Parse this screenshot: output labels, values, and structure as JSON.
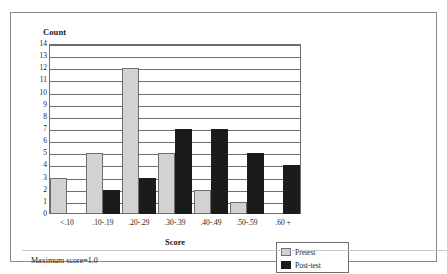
{
  "figure": {
    "footer_note": "Maximum score=1.0"
  },
  "chart_data": {
    "type": "bar",
    "title": "",
    "xlabel": "Score",
    "ylabel": "Count",
    "categories": [
      "<.10",
      ".10-.19",
      ".20-.29",
      ".30-.39",
      ".40-.49",
      ".50-.59",
      ".60 +"
    ],
    "series": [
      {
        "name": "Pretest",
        "color": "#d2d2d2",
        "values": [
          3,
          5,
          12,
          5,
          2,
          1,
          0
        ]
      },
      {
        "name": "Post-test",
        "color": "#1b1b1b",
        "values": [
          0,
          2,
          3,
          7,
          7,
          5,
          4
        ]
      }
    ],
    "ylim": [
      0,
      14
    ],
    "yticks": [
      0,
      1,
      2,
      3,
      4,
      5,
      6,
      7,
      8,
      9,
      10,
      11,
      12,
      13,
      14
    ],
    "ytick_labels": [
      "0",
      "1",
      "2",
      "3",
      "4",
      "5",
      "6",
      "7",
      "8",
      "9",
      "10",
      "11",
      "12",
      "13",
      "14"
    ],
    "grid": true,
    "grid_axis": "y",
    "legend_position": "bottom-right",
    "legend_entries": [
      "Pretest",
      "Post-test"
    ]
  }
}
